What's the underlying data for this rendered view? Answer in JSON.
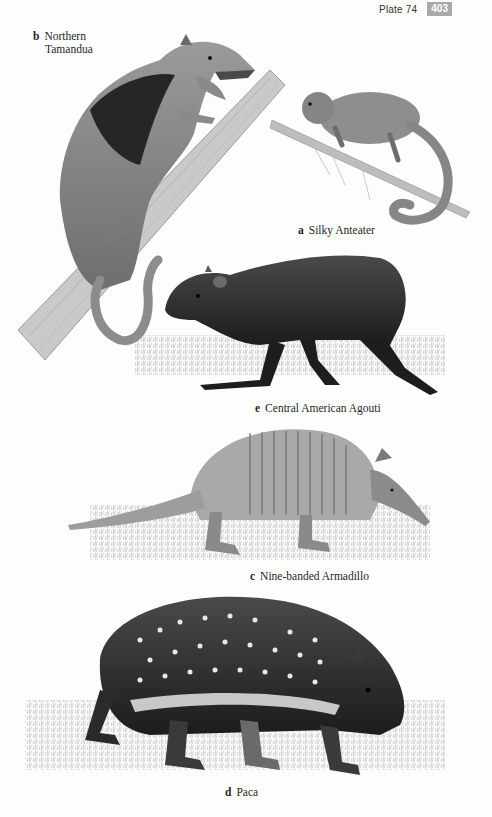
{
  "header": {
    "plate_label": "Plate 74",
    "page_number": "403"
  },
  "species": [
    {
      "letter": "b",
      "name_line1": "Northern",
      "name_line2": "Tamandua"
    },
    {
      "letter": "a",
      "name": "Silky Anteater"
    },
    {
      "letter": "e",
      "name": "Central American Agouti"
    },
    {
      "letter": "c",
      "name": "Nine-banded Armadillo"
    },
    {
      "letter": "d",
      "name": "Paca"
    }
  ],
  "colors": {
    "page_background": "#fdfdfd",
    "page_number_badge": "#a9a9a9",
    "ink_dark": "#1f1f1f"
  }
}
